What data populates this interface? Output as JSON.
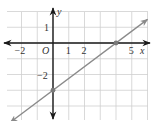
{
  "chart_data": {
    "type": "line",
    "title": "",
    "xlabel": "x",
    "ylabel": "y",
    "origin_label": "O",
    "x_tick_labels": [
      {
        "value": -2,
        "label": "−2"
      },
      {
        "value": 1,
        "label": "1"
      },
      {
        "value": 2,
        "label": "2"
      },
      {
        "value": 5,
        "label": "5"
      }
    ],
    "y_tick_labels": [
      {
        "value": 1,
        "label": "1"
      },
      {
        "value": -2,
        "label": "−2"
      }
    ],
    "xlim": [
      -3,
      6
    ],
    "ylim": [
      -5,
      2
    ],
    "grid": true,
    "series": [
      {
        "name": "line",
        "equation": "y = 3/4 x - 3",
        "x": [
          -2.7,
          6
        ],
        "y": [
          -5.025,
          1.5
        ],
        "color": "#8a8a8a",
        "arrows_both_ends": true
      }
    ],
    "marked_points": [
      {
        "x": 4,
        "y": 0,
        "label": "x-intercept"
      },
      {
        "x": 0,
        "y": -3,
        "label": "y-intercept"
      }
    ],
    "colors": {
      "grid": "#cfcfcf",
      "axis": "#1a1a1a",
      "line": "#8a8a8a",
      "point": "#7a7a7a"
    }
  }
}
